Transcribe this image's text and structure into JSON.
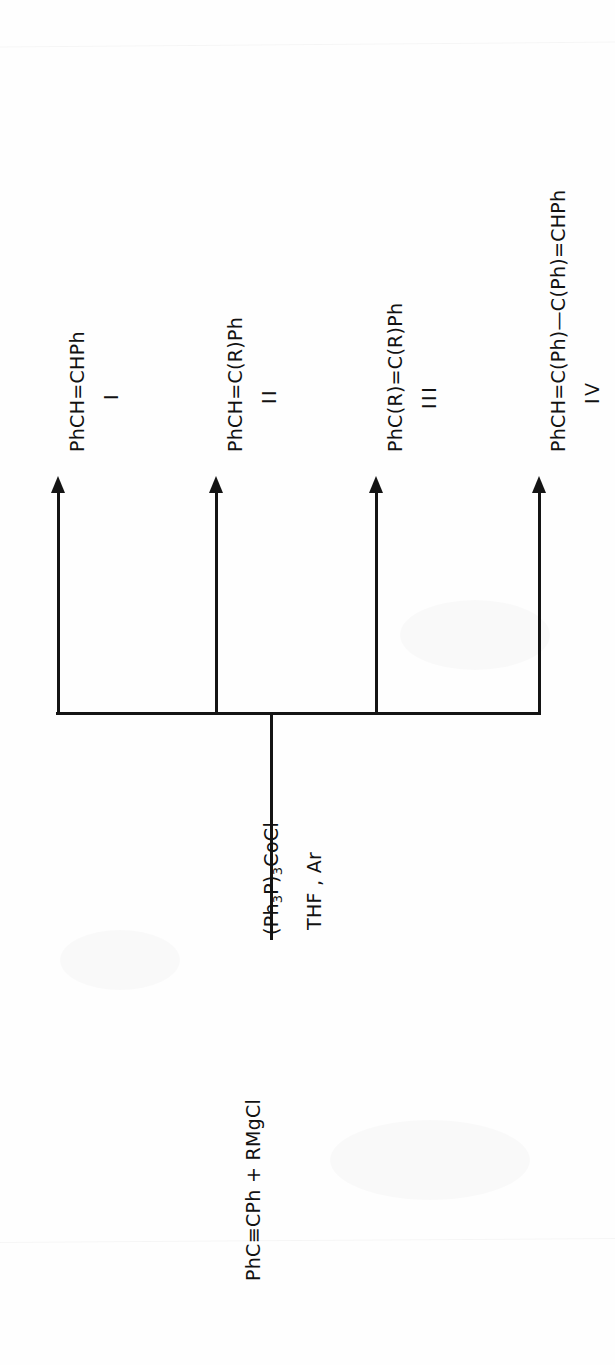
{
  "document": {
    "kind": "chemical-reaction-scheme",
    "background_color": "#fefefe",
    "ink_color": "#141414"
  },
  "scheme": {
    "substrate": {
      "label": "PhC≡CPh + RMgCl"
    },
    "conditions": {
      "catalyst_parts": {
        "pre": "(Ph",
        "sub1": "3",
        "mid": "P)",
        "sub2": "3",
        "post": "CoCl"
      },
      "catalyst_plain": "(Ph3P)3CoCl",
      "solvent": "THF , Ar"
    },
    "products": [
      {
        "formula": "PhCH=CHPh",
        "numeral": "I"
      },
      {
        "formula": "PhCH=C(R)Ph",
        "numeral": "II"
      },
      {
        "formula": "PhC(R)=C(R)Ph",
        "numeral": "III"
      },
      {
        "formula": "PhCH=C(Ph)—C(Ph)=CHPh",
        "numeral": "IV"
      }
    ]
  }
}
